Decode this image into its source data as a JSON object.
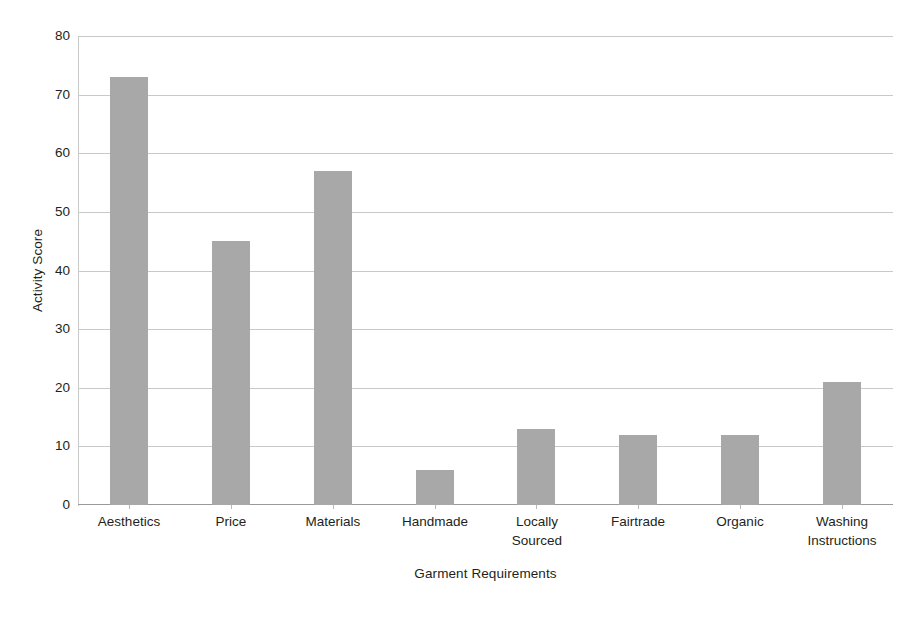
{
  "chart_data": {
    "type": "bar",
    "title": "",
    "xlabel": "Garment Requirements",
    "ylabel": "Activity Score",
    "categories": [
      "Aesthetics",
      "Price",
      "Materials",
      "Handmade",
      "Locally\nSourced",
      "Fairtrade",
      "Organic",
      "Washing\nInstructions"
    ],
    "values": [
      73,
      45,
      57,
      6,
      13,
      12,
      12,
      21
    ],
    "ylim": [
      0,
      80
    ],
    "yticks": [
      0,
      10,
      20,
      30,
      40,
      50,
      60,
      70,
      80
    ],
    "ytick_labels": [
      "0",
      "10",
      "20",
      "30",
      "40",
      "50",
      "60",
      "70",
      "80"
    ],
    "grid": "horizontal",
    "legend": "none",
    "bar_color": "#a8a8a8",
    "gridline_color": "#c9c9c9",
    "axis_color": "#9a9a9a",
    "text_color": "#231f20"
  }
}
